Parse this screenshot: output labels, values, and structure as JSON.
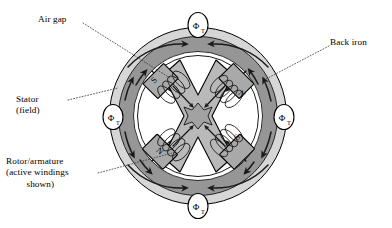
{
  "figure": {
    "type": "engineering-cross-section-diagram",
    "background_color": "#ffffff"
  },
  "callouts": [
    {
      "id": "air-gap",
      "text": "Air gap",
      "position": "top-left",
      "leader": "dotted"
    },
    {
      "id": "back-iron",
      "text": "Back iron",
      "position": "top-right",
      "leader": "dotted"
    },
    {
      "id": "stator",
      "line1": "Stator",
      "line2": "(field)",
      "position": "left",
      "leader": "dotted"
    },
    {
      "id": "rotor",
      "line1": "Rotor/armature",
      "line2": "(active windings",
      "line3": "shown)",
      "position": "bottom-left",
      "leader": "dotted"
    }
  ],
  "flux_badges": [
    {
      "id": "phi-top",
      "symbol": "Φ",
      "subscript": "T",
      "angle_deg": 90,
      "cx": 198,
      "cy": 25
    },
    {
      "id": "phi-right",
      "symbol": "Φ",
      "subscript": "T",
      "angle_deg": 0,
      "cx": 284,
      "cy": 117
    },
    {
      "id": "phi-bottom",
      "symbol": "Φ",
      "subscript": "T",
      "angle_deg": 270,
      "cx": 198,
      "cy": 206
    },
    {
      "id": "phi-left",
      "symbol": "Φ",
      "subscript": "T",
      "angle_deg": 180,
      "cx": 113,
      "cy": 117
    }
  ],
  "rotor_poles": [
    {
      "id": "pole-upper-left",
      "label": "S",
      "angle_deg": 135,
      "x": 159,
      "y": 83
    },
    {
      "id": "pole-upper-right",
      "label": "N",
      "angle_deg": 45,
      "x": 235,
      "y": 96
    },
    {
      "id": "pole-lower-left",
      "label": "N",
      "angle_deg": 225,
      "x": 160,
      "y": 151
    },
    {
      "id": "pole-lower-right",
      "label": "S",
      "angle_deg": 315,
      "x": 236,
      "y": 140
    }
  ],
  "geometry": {
    "center_x": 198,
    "center_y": 116,
    "outer_radius": 90,
    "back_iron_outer_radius": 88,
    "back_iron_inner_radius": 80,
    "stator_outer_radius": 80,
    "stator_inner_radius": 64,
    "air_gap_inner_radius": 60,
    "rotor_arm_length": 50,
    "rotor_arm_width": 17
  },
  "colors": {
    "back_iron_fill": "#d9d9d9",
    "stator_fill": "#9a9a9a",
    "rotor_core_fill": "#b8b8b8",
    "pole_fill": "#a8a8a8",
    "outline": "#000000",
    "leader_line": "#3a3a3a",
    "badge_fill": "#ffffff",
    "page_background": "#ffffff"
  },
  "flux_paths": {
    "description": "Curved flux arrows circulating through the stator back iron, splitting at each flux badge",
    "count": 8,
    "direction": "bidirectional-split"
  }
}
